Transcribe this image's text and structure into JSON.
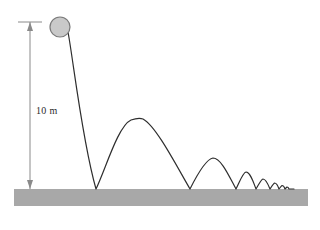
{
  "figure": {
    "title": "",
    "background_color": "#ffffff",
    "ball": {
      "label": "ball",
      "fill_color": "#c9c9c9",
      "stroke_color": "#7a7a7a",
      "cx": 60,
      "cy": 27,
      "r": 10
    },
    "ground": {
      "label": "ground",
      "fill_color": "#a8a8a8",
      "x": 14,
      "y": 189,
      "width": 294,
      "height": 17
    },
    "dimension": {
      "label": "10 m",
      "line_color": "#8a8a8a",
      "x": 30,
      "top_y": 22,
      "bottom_y": 189,
      "tick_x1": 18,
      "tick_x2": 42,
      "tick_y": 22
    },
    "trajectory": {
      "label": "bouncing-ball-path",
      "stroke_color": "#2e2e2e",
      "stroke_width": 1.2,
      "drop_start": {
        "x": 68,
        "y": 32
      },
      "bounce_points_x": [
        96,
        190,
        236,
        256,
        270,
        279,
        285,
        289
      ],
      "arc_peaks": [
        {
          "x": 143,
          "y": 119
        },
        {
          "x": 213,
          "y": 158
        },
        {
          "x": 246,
          "y": 172
        },
        {
          "x": 263,
          "y": 179
        },
        {
          "x": 274.5,
          "y": 183
        },
        {
          "x": 282,
          "y": 185.5
        },
        {
          "x": 287,
          "y": 187
        }
      ],
      "path": "M 68 32 C 73 58, 82 140, 96 189 C 106 168, 118 126, 131 120 C 137 118, 140 118, 143 119 C 156 126, 176 165, 190 189 C 197 175, 206 159, 213 158 C 221 158, 229 176, 236 189 C 240 181, 243 172.5, 246 172 C 250 172, 253 181, 256 189 C 259 184, 261 179.5, 263 179 C 266 179, 268 184, 270 189 C 272 186, 273.5 183.5, 274.5 183 C 276.5 183, 278 186, 279 189 C 280.5 187, 281.5 185.8, 282 185.5 C 283.5 185.5, 284.5 187.3, 285 189 C 286 188, 286.7 187.2, 287 187 C 288 187, 288.7 188.2, 289 189 L 294 189"
    }
  },
  "dimension_text": {
    "value": "10 m"
  }
}
